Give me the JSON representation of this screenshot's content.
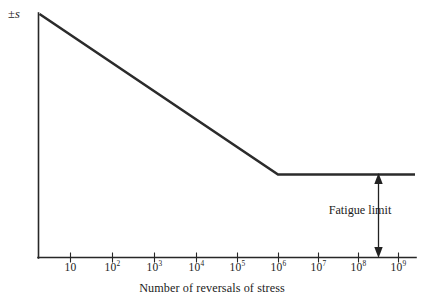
{
  "chart_data": {
    "type": "line",
    "title": "",
    "xlabel": "Number of reversals of stress",
    "ylabel": "±s",
    "ylabel_symbol": "±",
    "ylabel_variable": "s",
    "grid": false,
    "legend": "none",
    "xscale": "log",
    "xlim": [
      1,
      3000000000
    ],
    "ylim": [
      0,
      1
    ],
    "xtick_labels": [
      "10",
      "10²",
      "10³",
      "10⁴",
      "10⁵",
      "10⁶",
      "10⁷",
      "10⁸",
      "10⁹"
    ],
    "xticks": [
      {
        "base": "10",
        "exp": "",
        "exponent_value": 1
      },
      {
        "base": "10",
        "exp": "2",
        "exponent_value": 2
      },
      {
        "base": "10",
        "exp": "3",
        "exponent_value": 3
      },
      {
        "base": "10",
        "exp": "4",
        "exponent_value": 4
      },
      {
        "base": "10",
        "exp": "5",
        "exponent_value": 5
      },
      {
        "base": "10",
        "exp": "6",
        "exponent_value": 6
      },
      {
        "base": "10",
        "exp": "7",
        "exponent_value": 7
      },
      {
        "base": "10",
        "exp": "8",
        "exponent_value": 8
      },
      {
        "base": "10",
        "exp": "9",
        "exponent_value": 9
      }
    ],
    "series": [
      {
        "name": "S-N fatigue curve",
        "description": "Stress amplitude decreasing linearly with log cycles, then flat at the fatigue limit",
        "points": [
          {
            "x_exponent": 0.0,
            "y": 1.0
          },
          {
            "x_exponent": 6.0,
            "y": 0.345
          },
          {
            "x_exponent": 9.3,
            "y": 0.345
          }
        ]
      }
    ],
    "annotations": [
      {
        "name": "fatigue-limit",
        "text": "Fatigue limit",
        "type": "double-headed-arrow",
        "x_exponent": 8.45,
        "y_from": 0.0,
        "y_to": 0.345
      }
    ],
    "knee_point": {
      "x_exponent": 6.0,
      "label": "10⁶"
    },
    "colors": {
      "curve": "#2b2b2b",
      "axis": "#272727",
      "annotation": "#222222",
      "text": "#1c1c1c",
      "background": "#ffffff"
    }
  },
  "axis": {
    "y_label_prefix": "±",
    "y_label_variable": "s",
    "x_title": "Number of reversals of stress"
  },
  "annotation": {
    "fatigue_limit_text": "Fatigue limit"
  }
}
